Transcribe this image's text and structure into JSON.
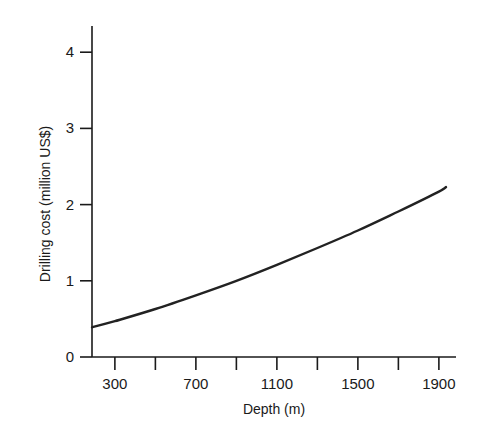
{
  "chart_data": {
    "type": "line",
    "title": "",
    "xlabel": "Depth (m)",
    "ylabel": "Drilling cost (million US$)",
    "xlim": [
      187,
      1985
    ],
    "ylim": [
      0,
      4.3
    ],
    "x_ticks": [
      300,
      500,
      700,
      900,
      1100,
      1300,
      1500,
      1700,
      1900
    ],
    "x_tick_labels": [
      "300",
      "",
      "700",
      "",
      "1100",
      "",
      "1500",
      "",
      "1900"
    ],
    "y_ticks": [
      0,
      1,
      2,
      3,
      4
    ],
    "y_tick_labels": [
      "0",
      "1",
      "2",
      "3",
      "4"
    ],
    "grid": false,
    "legend": null,
    "series": [
      {
        "name": "Drilling cost",
        "x": [
          187,
          300,
          500,
          700,
          900,
          1100,
          1300,
          1500,
          1700,
          1900,
          1935
        ],
        "values": [
          0.39,
          0.47,
          0.63,
          0.81,
          1.0,
          1.21,
          1.43,
          1.66,
          1.91,
          2.17,
          2.23
        ],
        "color": "#222222"
      }
    ]
  }
}
